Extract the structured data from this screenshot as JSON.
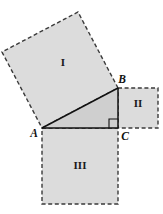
{
  "figure": {
    "canvas": {
      "width": 163,
      "height": 214
    },
    "colors": {
      "square_fill": "#dcdcdc",
      "triangle_fill": "#cfcfcf",
      "dashed_stroke": "#3a3a3a",
      "solid_stroke": "#111111",
      "background": "#ffffff",
      "label_color": "#1a1a1a"
    },
    "triangle": {
      "name": "right-triangle-abc",
      "right_angle_at": "C",
      "vertices": [
        {
          "label": "A",
          "x": 42,
          "y": 128,
          "label_x": 34,
          "label_y": 134
        },
        {
          "label": "B",
          "x": 118,
          "y": 88,
          "label_x": 122,
          "label_y": 80
        },
        {
          "label": "C",
          "x": 118,
          "y": 128,
          "label_x": 125,
          "label_y": 137
        }
      ],
      "right_angle_marker": {
        "size": 9
      }
    },
    "squares": [
      {
        "label": "I",
        "name": "square-on-hypotenuse",
        "side": "AB",
        "points": "42,128 118,88 78,12 2,52",
        "label_x": 63,
        "label_y": 63
      },
      {
        "label": "II",
        "name": "square-on-side-bc",
        "side": "BC",
        "points": "118,88 158,88 158,128 118,128",
        "label_x": 138,
        "label_y": 104
      },
      {
        "label": "III",
        "name": "square-on-side-ac",
        "side": "AC",
        "points": "42,128 118,128 118,204 42,204",
        "label_x": 80,
        "label_y": 166
      }
    ]
  }
}
